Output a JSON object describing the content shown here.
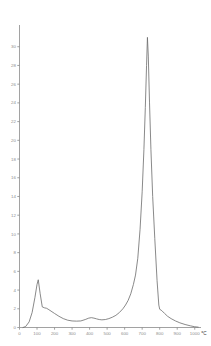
{
  "chart_data": {
    "type": "line",
    "title": "",
    "subtitle": "",
    "xlabel": "",
    "ylabel": "",
    "x_unit": "℃",
    "xlim": [
      0,
      1030
    ],
    "ylim": [
      0,
      32
    ],
    "grid": false,
    "legend": null,
    "x_ticks": [
      0,
      100,
      200,
      300,
      400,
      500,
      600,
      700,
      800,
      900,
      1000
    ],
    "x_tick_labels": [
      "0",
      "100",
      "200",
      "300",
      "400",
      "500",
      "600",
      "700",
      "800",
      "900",
      "1000"
    ],
    "y_ticks": [
      0,
      2,
      4,
      6,
      8,
      10,
      12,
      14,
      16,
      18,
      20,
      22,
      24,
      26,
      28,
      30
    ],
    "y_tick_labels": [
      "0",
      "2",
      "4",
      "6",
      "8",
      "10",
      "12",
      "14",
      "16",
      "18",
      "20",
      "22",
      "24",
      "26",
      "28",
      "30"
    ],
    "series": [
      {
        "name": "thermal-curve",
        "color": "#6b6b6b",
        "x": [
          20,
          35,
          55,
          72,
          88,
          100,
          107,
          118,
          130,
          143,
          155,
          168,
          180,
          200,
          225,
          250,
          275,
          300,
          325,
          350,
          375,
          395,
          410,
          425,
          440,
          455,
          470,
          490,
          510,
          530,
          550,
          570,
          590,
          605,
          620,
          635,
          650,
          662,
          675,
          688,
          700,
          710,
          718,
          725,
          730,
          735,
          742,
          750,
          760,
          772,
          785,
          795,
          800,
          812,
          828,
          845,
          865,
          890,
          915,
          945,
          975,
          1000,
          1020
        ],
        "y": [
          0.0,
          0.1,
          0.6,
          1.6,
          3.2,
          4.6,
          5.1,
          3.6,
          2.2,
          2.1,
          2.05,
          1.9,
          1.75,
          1.5,
          1.2,
          0.95,
          0.78,
          0.7,
          0.68,
          0.7,
          0.85,
          1.0,
          1.05,
          1.0,
          0.92,
          0.85,
          0.82,
          0.85,
          0.95,
          1.1,
          1.3,
          1.6,
          2.0,
          2.4,
          2.9,
          3.6,
          4.6,
          5.6,
          7.4,
          10.5,
          14.5,
          19.0,
          23.5,
          28.0,
          31.0,
          29.0,
          24.0,
          19.0,
          14.0,
          9.5,
          5.0,
          2.4,
          1.95,
          1.8,
          1.5,
          1.2,
          0.95,
          0.7,
          0.5,
          0.32,
          0.18,
          0.08,
          0.04
        ]
      }
    ],
    "annotations": [
      {
        "name": "low-temperature-peak",
        "x": 107,
        "y": 5.1
      },
      {
        "name": "main-peak",
        "x": 730,
        "y": 31.0
      },
      {
        "name": "abrupt-drop-shoulder",
        "x": 800,
        "y": 1.95
      }
    ]
  },
  "axes": {
    "y_axis_name": "y-axis",
    "x_axis_name": "x-axis"
  }
}
